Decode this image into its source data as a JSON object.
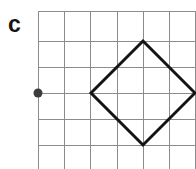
{
  "figure": {
    "panel_label": "c",
    "background_color": "#ffffff"
  },
  "chart_data": {
    "type": "scatter",
    "title": "c",
    "xlabel": "",
    "ylabel": "",
    "grid": true,
    "legend_position": "none",
    "axis_units": "grid squares",
    "grid_spacing_px": 26,
    "grid_origin_px": {
      "x": 38,
      "y": 11
    },
    "grid_columns": 6,
    "grid_rows": 5,
    "xlim": [
      0,
      6
    ],
    "ylim": [
      0,
      5
    ],
    "grid_line_color": "#8c8c8c",
    "grid_line_width_px": 1,
    "shape_color": "#141414",
    "shape_line_width_px": 3,
    "point_color": "#3c3c3c",
    "point_radius_px": 4.5,
    "shapes": [
      {
        "name": "diamond",
        "type": "polygon",
        "closed": true,
        "vertices_grid": [
          {
            "x": 4,
            "y": 4
          },
          {
            "x": 6,
            "y": 2
          },
          {
            "x": 4,
            "y": 0
          },
          {
            "x": 2,
            "y": 2
          }
        ],
        "vertices_px": [
          {
            "x": 143,
            "y": 41
          },
          {
            "x": 195,
            "y": 93
          },
          {
            "x": 143,
            "y": 145
          },
          {
            "x": 91,
            "y": 93
          }
        ]
      }
    ],
    "points": [
      {
        "name": "center-of-rotation",
        "grid": {
          "x": 0,
          "y": 2
        },
        "px": {
          "x": 38,
          "y": 93
        },
        "label": ""
      }
    ],
    "vertical_gridlines_px": [
      38,
      64,
      90,
      117,
      143,
      169,
      195
    ],
    "horizontal_gridlines_px": [
      11,
      41,
      67,
      93,
      119,
      145
    ]
  }
}
